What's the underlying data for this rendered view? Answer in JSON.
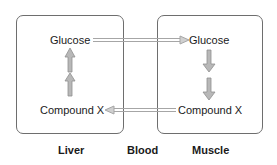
{
  "diagram": {
    "compartments": [
      {
        "id": "liver",
        "label": "Liver"
      },
      {
        "id": "blood",
        "label": "Blood"
      },
      {
        "id": "muscle",
        "label": "Muscle"
      }
    ],
    "nodes": {
      "liver_glucose": "Glucose",
      "liver_compound": "Compound X",
      "muscle_glucose": "Glucose",
      "muscle_compound": "Compound X"
    },
    "edges": [
      {
        "from": "liver_glucose",
        "to": "muscle_glucose",
        "via": "Blood",
        "direction": "right"
      },
      {
        "from": "muscle_glucose",
        "to": "muscle_compound",
        "direction": "down",
        "arrow_count": 2
      },
      {
        "from": "muscle_compound",
        "to": "liver_compound",
        "via": "Blood",
        "direction": "left"
      },
      {
        "from": "liver_compound",
        "to": "liver_glucose",
        "direction": "up",
        "arrow_count": 2
      }
    ],
    "colors": {
      "box_border": "#6e6e6e",
      "arrow": "#a6a6a6",
      "text": "#1a1a1a"
    }
  }
}
